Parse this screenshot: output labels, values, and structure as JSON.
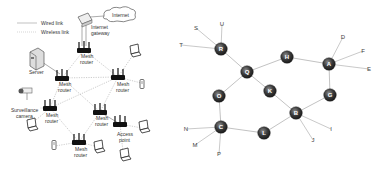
{
  "left_diagram": {
    "legend": {
      "wired": "Wired link",
      "wireless": "Wireless link"
    },
    "labels": {
      "internet": "Internet",
      "gateway_line1": "Internet",
      "gateway_line2": "gateway",
      "server": "Server",
      "camera_line1": "Surveillance",
      "camera_line2": "camera",
      "mesh_line1": "Mesh",
      "mesh_line2": "router",
      "ap_line1": "Access",
      "ap_line2": "point"
    }
  },
  "right_graph": {
    "nodes": [
      {
        "id": "R",
        "x": 221,
        "y": 49
      },
      {
        "id": "Q",
        "x": 247,
        "y": 72
      },
      {
        "id": "H",
        "x": 287,
        "y": 57
      },
      {
        "id": "A",
        "x": 329,
        "y": 64
      },
      {
        "id": "O",
        "x": 219,
        "y": 96
      },
      {
        "id": "K",
        "x": 270,
        "y": 91
      },
      {
        "id": "G",
        "x": 330,
        "y": 95
      },
      {
        "id": "B",
        "x": 296,
        "y": 113
      },
      {
        "id": "C",
        "x": 221,
        "y": 127
      },
      {
        "id": "L",
        "x": 264,
        "y": 133
      }
    ],
    "leaves": [
      {
        "id": "U",
        "x": 222,
        "y": 24,
        "parent": "R"
      },
      {
        "id": "S",
        "x": 196,
        "y": 28,
        "parent": "R"
      },
      {
        "id": "T",
        "x": 181,
        "y": 45,
        "parent": "R"
      },
      {
        "id": "D",
        "x": 343,
        "y": 37,
        "parent": "A"
      },
      {
        "id": "F",
        "x": 363,
        "y": 51,
        "parent": "A"
      },
      {
        "id": "E",
        "x": 369,
        "y": 69,
        "parent": "A"
      },
      {
        "id": "I",
        "x": 331,
        "y": 129,
        "parent": "B"
      },
      {
        "id": "J",
        "x": 313,
        "y": 140,
        "parent": "B"
      },
      {
        "id": "N",
        "x": 186,
        "y": 129,
        "parent": "C"
      },
      {
        "id": "M",
        "x": 195,
        "y": 145,
        "parent": "C"
      },
      {
        "id": "P",
        "x": 219,
        "y": 154,
        "parent": "C"
      }
    ],
    "edges": [
      [
        "R",
        "Q"
      ],
      [
        "Q",
        "H"
      ],
      [
        "H",
        "A"
      ],
      [
        "A",
        "G"
      ],
      [
        "G",
        "B"
      ],
      [
        "Q",
        "K"
      ],
      [
        "K",
        "B"
      ],
      [
        "Q",
        "O"
      ],
      [
        "O",
        "C"
      ],
      [
        "C",
        "L"
      ],
      [
        "L",
        "B"
      ]
    ]
  }
}
